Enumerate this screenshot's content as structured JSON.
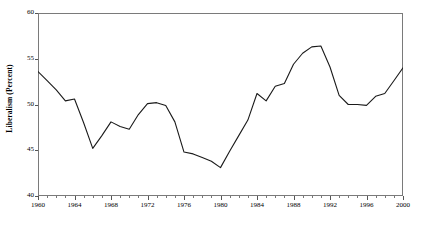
{
  "chart_data": {
    "type": "line",
    "title": "",
    "subtitle": "",
    "xlabel": "",
    "ylabel": "Liberalism (Percent)",
    "xlim": [
      1960,
      2000
    ],
    "ylim": [
      40,
      60
    ],
    "yticks": [
      40,
      45,
      50,
      55,
      60
    ],
    "ytick_labels": [
      "40",
      "45",
      "50",
      "55",
      "60"
    ],
    "xticks": [
      1960,
      1964,
      1968,
      1972,
      1976,
      1980,
      1984,
      1988,
      1992,
      1996,
      2000
    ],
    "xtick_labels": [
      "1960",
      "1964",
      "1968",
      "1972",
      "1976",
      "1980",
      "1984",
      "1988",
      "1992",
      "1996",
      "2000"
    ],
    "x_minor_tick_interval": 1,
    "grid": false,
    "legend": null,
    "legend_position": "none",
    "line_color": "#1a1a1a",
    "line_width": 1.1,
    "frame_color": "#7a7a7a",
    "background_color": "#ffffff",
    "x": [
      1960,
      1961,
      1962,
      1963,
      1964,
      1965,
      1966,
      1967,
      1968,
      1969,
      1970,
      1971,
      1972,
      1973,
      1974,
      1975,
      1976,
      1977,
      1978,
      1979,
      1980,
      1981,
      1982,
      1983,
      1984,
      1985,
      1986,
      1987,
      1988,
      1989,
      1990,
      1991,
      1992,
      1993,
      1994,
      1995,
      1996,
      1997,
      1998,
      1999,
      2000
    ],
    "values": [
      53.6,
      52.6,
      51.6,
      50.4,
      50.6,
      48.0,
      45.2,
      46.6,
      48.1,
      47.6,
      47.3,
      48.9,
      50.1,
      50.2,
      49.9,
      48.1,
      44.8,
      44.6,
      44.2,
      43.8,
      43.1,
      44.9,
      46.6,
      48.3,
      51.2,
      50.4,
      52.0,
      52.3,
      54.4,
      55.6,
      56.3,
      56.4,
      54.1,
      51.0,
      50.0,
      50.0,
      49.9,
      50.9,
      51.2,
      52.6,
      54.0
    ],
    "series_name": "Liberalism"
  },
  "figure": {
    "width": 425,
    "height": 233
  }
}
